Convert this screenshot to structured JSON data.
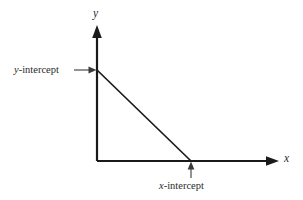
{
  "figure": {
    "type": "coordinate-axes-diagram",
    "background_color": "#ffffff",
    "stroke_color": "#1a1a1a",
    "text_color": "#2b2b2b",
    "axes": {
      "y_axis_label_var": "y",
      "x_axis_label_var": "x",
      "origin": {
        "x": 97,
        "y": 161
      },
      "y_axis_top": 26,
      "x_axis_right": 278
    },
    "line": {
      "from": {
        "x": 97,
        "y": 70
      },
      "to": {
        "x": 191,
        "y": 161
      }
    },
    "annotations": {
      "y_intercept": {
        "var": "y",
        "suffix": "-intercept",
        "point": {
          "x": 97,
          "y": 70
        },
        "arrow_direction": "right"
      },
      "x_intercept": {
        "var": "x",
        "suffix": "-intercept",
        "point": {
          "x": 191,
          "y": 161
        },
        "arrow_direction": "up"
      }
    }
  }
}
